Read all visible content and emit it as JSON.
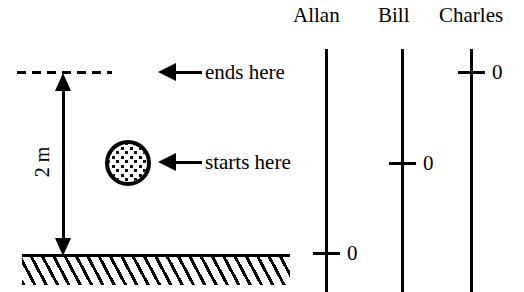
{
  "figure": {
    "type": "physics-diagram",
    "title_fragment_cutoff": "",
    "height_label": "2 m",
    "callouts": {
      "ends_here": "ends here",
      "starts_here": "starts here"
    },
    "ball": {
      "name": "ball",
      "fill": "#ffffff",
      "outline": "#000000",
      "texture": "speckled"
    },
    "ground": {
      "name": "ground",
      "hatch": "diagonal"
    },
    "dashed_level": {
      "name": "end-height-level",
      "style": "dashed"
    }
  },
  "observers": [
    {
      "name": "Allan",
      "zero_label": "0",
      "zero_position": "ground-level"
    },
    {
      "name": "Bill",
      "zero_label": "0",
      "zero_position": "ball-start-level"
    },
    {
      "name": "Charles",
      "zero_label": "0",
      "zero_position": "ball-end-level"
    }
  ],
  "colors": {
    "ink": "#000000",
    "background": "#ffffff"
  }
}
